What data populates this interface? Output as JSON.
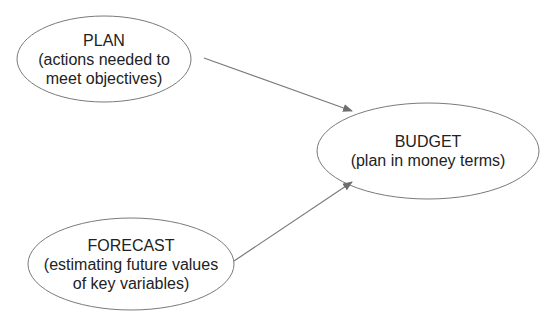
{
  "diagram": {
    "type": "flow",
    "colors": {
      "stroke": "#7a7a7a",
      "arrow": "#6e6e6e",
      "text": "#222222",
      "background": "#ffffff"
    },
    "nodes": [
      {
        "id": "plan",
        "title": "PLAN",
        "lines": [
          "(actions needed to",
          "meet objectives)"
        ],
        "cx": 104,
        "cy": 59,
        "rx": 87,
        "ry": 43
      },
      {
        "id": "budget",
        "title": "BUDGET",
        "lines": [
          "(plan in money terms)"
        ],
        "cx": 428,
        "cy": 151,
        "rx": 111,
        "ry": 48
      },
      {
        "id": "forecast",
        "title": "FORECAST",
        "lines": [
          "(estimating future values",
          "of key variables)"
        ],
        "cx": 131,
        "cy": 264,
        "rx": 103,
        "ry": 46
      }
    ],
    "edges": [
      {
        "from": "plan",
        "to": "budget"
      },
      {
        "from": "forecast",
        "to": "budget"
      }
    ]
  }
}
